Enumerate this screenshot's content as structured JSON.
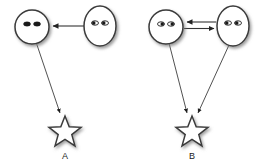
{
  "figure": {
    "background_color": "#ffffff",
    "stroke_color": "#3a3a3a",
    "fill_color": "#ffffff",
    "eye_color": "#1a1a1a",
    "label_color": "#222222"
  },
  "panels": [
    {
      "id": "A",
      "label": "A",
      "label_position": {
        "x": 65,
        "y": 158
      },
      "agents": [
        {
          "name": "left-face",
          "shape": "circle",
          "center": {
            "x": 32,
            "y": 27
          },
          "radius": 17,
          "gaze": "right",
          "eyes": [
            {
              "cx": 27,
              "cy": 24,
              "rx": 3.4,
              "ry": 2.1,
              "pupil_offset": 1.3
            },
            {
              "cx": 37,
              "cy": 24,
              "rx": 3.4,
              "ry": 2.1,
              "pupil_offset": 1.3
            }
          ]
        },
        {
          "name": "right-face",
          "shape": "ellipse",
          "center": {
            "x": 100,
            "y": 26
          },
          "rx": 16,
          "ry": 20,
          "gaze": "left",
          "eyes": [
            {
              "cx": 95,
              "cy": 23,
              "rx": 3.4,
              "ry": 2.1,
              "pupil_offset": -1.3
            },
            {
              "cx": 105,
              "cy": 23,
              "rx": 3.4,
              "ry": 2.1,
              "pupil_offset": -1.3
            }
          ]
        }
      ],
      "objects": [
        {
          "name": "star",
          "shape": "star",
          "center": {
            "x": 65,
            "y": 132
          },
          "outer_radius": 16,
          "inner_radius": 7,
          "points": 5
        }
      ],
      "arrows": [
        {
          "name": "gaze-arrow-right-to-left-face",
          "from": "right-face",
          "to": "left-face",
          "start": {
            "x": 84,
            "y": 26
          },
          "end": {
            "x": 51,
            "y": 26
          },
          "direction": "left",
          "arrowhead": "end"
        },
        {
          "name": "gaze-arrow-left-face-to-star",
          "from": "left-face",
          "to": "star",
          "start": {
            "x": 36,
            "y": 43
          },
          "end": {
            "x": 59,
            "y": 112
          },
          "direction": "down-right",
          "arrowhead": "end"
        }
      ]
    },
    {
      "id": "B",
      "label": "B",
      "label_position": {
        "x": 192,
        "y": 158
      },
      "agents": [
        {
          "name": "left-face",
          "shape": "circle",
          "center": {
            "x": 166,
            "y": 27
          },
          "radius": 17,
          "gaze": "right",
          "eyes": [
            {
              "cx": 161,
              "cy": 24,
              "rx": 3.4,
              "ry": 2.1,
              "pupil_offset": 1.3
            },
            {
              "cx": 171,
              "cy": 24,
              "rx": 3.4,
              "ry": 2.1,
              "pupil_offset": 1.3
            }
          ]
        },
        {
          "name": "right-face",
          "shape": "ellipse",
          "center": {
            "x": 233,
            "y": 26
          },
          "rx": 16,
          "ry": 20,
          "gaze": "left",
          "eyes": [
            {
              "cx": 228,
              "cy": 23,
              "rx": 3.4,
              "ry": 2.1,
              "pupil_offset": -1.3
            },
            {
              "cx": 238,
              "cy": 23,
              "rx": 3.4,
              "ry": 2.1,
              "pupil_offset": -1.3
            }
          ]
        }
      ],
      "objects": [
        {
          "name": "star",
          "shape": "star",
          "center": {
            "x": 192,
            "y": 132
          },
          "outer_radius": 16,
          "inner_radius": 7,
          "points": 5
        }
      ],
      "arrows": [
        {
          "name": "gaze-arrow-right-to-left-face",
          "from": "right-face",
          "to": "left-face",
          "start": {
            "x": 217,
            "y": 22
          },
          "end": {
            "x": 185,
            "y": 22
          },
          "direction": "left",
          "arrowhead": "end"
        },
        {
          "name": "gaze-arrow-left-to-right-face",
          "from": "left-face",
          "to": "right-face",
          "start": {
            "x": 185,
            "y": 28
          },
          "end": {
            "x": 217,
            "y": 28
          },
          "direction": "right",
          "arrowhead": "end"
        },
        {
          "name": "gaze-arrow-left-face-to-star",
          "from": "left-face",
          "to": "star",
          "start": {
            "x": 170,
            "y": 43
          },
          "end": {
            "x": 186,
            "y": 112
          },
          "direction": "down-right",
          "arrowhead": "end"
        },
        {
          "name": "gaze-arrow-right-face-to-star",
          "from": "right-face",
          "to": "star",
          "start": {
            "x": 228,
            "y": 44
          },
          "end": {
            "x": 197,
            "y": 112
          },
          "direction": "down-left",
          "arrowhead": "end"
        }
      ]
    }
  ]
}
